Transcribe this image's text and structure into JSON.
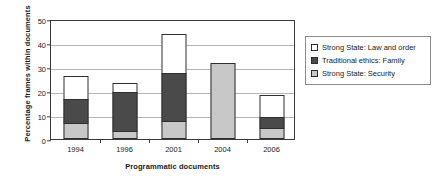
{
  "chart_data": {
    "type": "bar",
    "subtype": "stacked",
    "title": "",
    "xlabel": "Programmatic documents",
    "ylabel": "Percentage frames within documents",
    "categories": [
      "1994",
      "1996",
      "2001",
      "2004",
      "2006"
    ],
    "ylim": [
      0,
      50
    ],
    "yticks": [
      0,
      10,
      20,
      30,
      40,
      50
    ],
    "ytick_labels": [
      "0",
      "10",
      "20",
      "30",
      "40",
      "50"
    ],
    "grid": true,
    "legend_position": "right",
    "series": [
      {
        "name": "Strong State: Security",
        "color": "#c8c8c8",
        "values": [
          6.5,
          3.5,
          7.5,
          31.5,
          4.5
        ]
      },
      {
        "name": "Traditional ethics: Family",
        "color": "#4a4a4a",
        "values": [
          10.5,
          16.5,
          20.5,
          0,
          5.0
        ]
      },
      {
        "name": "Strong State: Law and order",
        "color": "#ffffff",
        "values": [
          10.0,
          4.0,
          16.5,
          0,
          9.5
        ]
      }
    ],
    "totals": [
      27.0,
      24.0,
      44.5,
      31.5,
      19.0
    ]
  },
  "legend": {
    "items": [
      {
        "label": "Strong State: Law and order",
        "color": "#ffffff"
      },
      {
        "label": "Traditional ethics: Family",
        "color": "#4a4a4a"
      },
      {
        "label": "Strong State: Security",
        "color": "#c8c8c8"
      }
    ]
  },
  "colors": {
    "axis": "#3a3a3a",
    "grid": "#b4b4b4",
    "bar_outline": "#2f2f2f",
    "background": "#ffffff"
  }
}
